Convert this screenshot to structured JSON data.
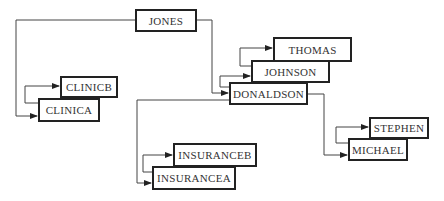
{
  "diagram": {
    "type": "linked-list-tree",
    "nodes": {
      "jones": "JONES",
      "clinicb": "CLINICB",
      "clinica": "CLINICA",
      "thomas": "THOMAS",
      "johnson": "JOHNSON",
      "donaldson": "DONALDSON",
      "stephen": "STEPHEN",
      "michael": "MICHAEL",
      "insuranceb": "INSURANCEB",
      "insurancea": "INSURANCEA"
    },
    "edges": [
      {
        "from": "JONES",
        "to": "CLINICA"
      },
      {
        "from": "JONES",
        "to": "DONALDSON"
      },
      {
        "from": "CLINICA",
        "to": "CLINICB"
      },
      {
        "from": "DONALDSON",
        "to": "JOHNSON"
      },
      {
        "from": "JOHNSON",
        "to": "THOMAS"
      },
      {
        "from": "DONALDSON",
        "to": "MICHAEL"
      },
      {
        "from": "DONALDSON",
        "to": "INSURANCEA"
      },
      {
        "from": "MICHAEL",
        "to": "STEPHEN"
      },
      {
        "from": "INSURANCEA",
        "to": "INSURANCEB"
      }
    ],
    "colors": {
      "border": "#222222",
      "line": "#444444",
      "text": "#333333",
      "background": "#ffffff"
    }
  }
}
